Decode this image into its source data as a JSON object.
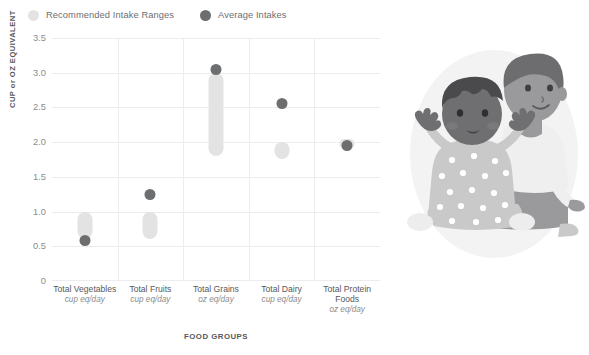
{
  "legend": {
    "items": [
      {
        "label": "Recommended Intake Ranges",
        "color": "#e3e3e3",
        "key": "range"
      },
      {
        "label": "Average Intakes",
        "color": "#6d6e70",
        "key": "average"
      }
    ]
  },
  "axes": {
    "y_title": "CUP or OZ EQUIVALENT",
    "x_title": "FOOD GROUPS"
  },
  "chart_data": {
    "type": "bar",
    "title": "",
    "xlabel": "FOOD GROUPS",
    "ylabel": "CUP or OZ EQUIVALENT",
    "ylim": [
      0,
      3.5
    ],
    "yticks": [
      "0",
      "0.5",
      "1.0",
      "1.5",
      "2.0",
      "2.5",
      "3.0",
      "3.5"
    ],
    "ytick_values": [
      0,
      0.5,
      1.0,
      1.5,
      2.0,
      2.5,
      3.0,
      3.5
    ],
    "grid": true,
    "legend_position": "top-left",
    "categories": [
      "Total Vegetables",
      "Total Fruits",
      "Total Grains",
      "Total Dairy",
      "Total Protein Foods"
    ],
    "category_units": [
      "cup eq/day",
      "cup eq/day",
      "oz eq/day",
      "cup eq/day",
      "oz eq/day"
    ],
    "series": [
      {
        "name": "Recommended Intake Ranges",
        "type": "range",
        "color": "#e3e3e3",
        "ranges": [
          {
            "low": 0.6,
            "high": 1.0
          },
          {
            "low": 0.6,
            "high": 1.0
          },
          {
            "low": 1.8,
            "high": 3.0
          },
          {
            "low": 1.75,
            "high": 2.0
          },
          {
            "low": 1.9,
            "high": 2.05
          }
        ]
      },
      {
        "name": "Average Intakes",
        "type": "point",
        "color": "#6d6e70",
        "values": [
          0.58,
          1.25,
          3.05,
          2.55,
          1.95
        ]
      }
    ]
  },
  "illustration": {
    "name": "two-children-sitting-illustration",
    "colors": {
      "backdrop": "#f2f2f2",
      "skin_dark": "#6f6f71",
      "skin_light": "#9a9a9c",
      "hair_dark": "#4a4a4c",
      "hair_mid": "#6d6d6f",
      "clothing_gray": "#c9c9c9",
      "clothing_light": "#ededed",
      "dots": "#ffffff"
    }
  }
}
